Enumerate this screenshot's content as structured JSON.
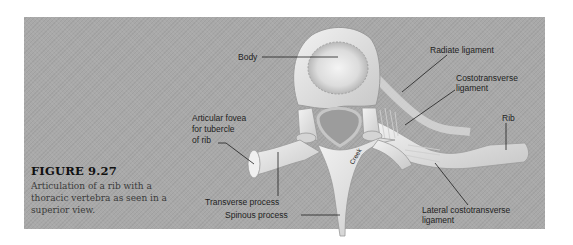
{
  "figure": {
    "number": "FIGURE 9.27",
    "caption": "Articulation of a rib with a thoracic vertebra as seen in a superior view."
  },
  "labels": {
    "body": "Body",
    "radiate_ligament": "Radiate ligament",
    "costotransverse_ligament_line1": "Costotransverse",
    "costotransverse_ligament_line2": "ligament",
    "rib": "Rib",
    "articular_fovea_line1": "Articular fovea",
    "articular_fovea_line2": "for tubercle",
    "articular_fovea_line3": "of rib",
    "transverse_process": "Transverse process",
    "spinous_process": "Spinous process",
    "lateral_costotransverse_line1": "Lateral costotransverse",
    "lateral_costotransverse_line2": "ligament",
    "creek": "Creek"
  },
  "colors": {
    "background": "#a9a9a9",
    "bone": "#e4e4e4",
    "bone_shadow": "#bdbdbd",
    "leader_line": "#1e1e1e"
  }
}
